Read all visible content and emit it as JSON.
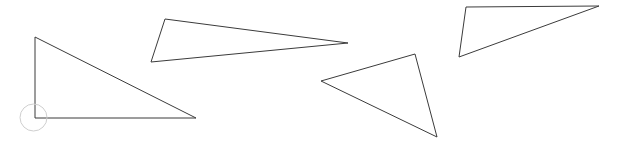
{
  "canvas": {
    "name": "triangles-canvas",
    "width": 617,
    "height": 152,
    "background_color": "#ffffff",
    "stroke_color": "#3b3b3b",
    "stroke_width": 1,
    "title": "Triangles"
  },
  "shapes": [
    {
      "id": "triangle-1",
      "label": "Right triangle (lower left)",
      "kind": "triangle",
      "stroke_color": "#3b3b3b",
      "points": "35,37 35,118 196,118",
      "vertices": [
        {
          "name": "apex",
          "x": 35,
          "y": 37
        },
        {
          "name": "right-angle",
          "x": 35,
          "y": 118
        },
        {
          "name": "base-right",
          "x": 196,
          "y": 118
        }
      ]
    },
    {
      "id": "triangle-2",
      "label": "Slim triangle (upper middle)",
      "kind": "triangle",
      "stroke_color": "#3b3b3b",
      "points": "165,19 348,43 151,62",
      "vertices": [
        {
          "name": "top-left",
          "x": 165,
          "y": 19
        },
        {
          "name": "right-tip",
          "x": 348,
          "y": 43
        },
        {
          "name": "bottom-left",
          "x": 151,
          "y": 62
        }
      ]
    },
    {
      "id": "triangle-3",
      "label": "Triangle (lower middle right)",
      "kind": "triangle",
      "stroke_color": "#3b3b3b",
      "points": "321,81 415,54 437,137",
      "vertices": [
        {
          "name": "left-tip",
          "x": 321,
          "y": 81
        },
        {
          "name": "top",
          "x": 415,
          "y": 54
        },
        {
          "name": "bottom",
          "x": 437,
          "y": 137
        }
      ]
    },
    {
      "id": "triangle-4",
      "label": "Triangle (top right)",
      "kind": "triangle",
      "stroke_color": "#3b3b3b",
      "points": "466,7 599,6 459,57",
      "vertices": [
        {
          "name": "top-left",
          "x": 466,
          "y": 7
        },
        {
          "name": "top-right",
          "x": 599,
          "y": 6
        },
        {
          "name": "bottom-left",
          "x": 459,
          "y": 57
        }
      ]
    }
  ],
  "snap_indicator": {
    "id": "vertex-snap-ring",
    "label": "Vertex snap indicator",
    "color": "#cfcfcf",
    "cx": 33.5,
    "cy": 117.5,
    "r": 13.5
  }
}
